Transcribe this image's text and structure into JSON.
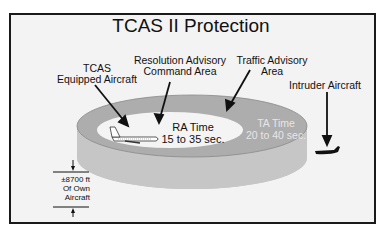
{
  "title": "TCAS II Protection",
  "labels": {
    "tcas_equipped": [
      "TCAS",
      "Equipped Aircraft"
    ],
    "ra_area": [
      "Resolution Advisory",
      "Command Area"
    ],
    "ta_area": [
      "Traffic Advisory",
      "Area"
    ],
    "intruder": "Intruder Aircraft"
  },
  "zones": {
    "ra": {
      "name": "RA Time",
      "range": "15 to 35 sec.",
      "color": "#f4f4f4"
    },
    "ta": {
      "name": "TA Time",
      "range": "20 to 40 sec.",
      "color": "#b0b0b0"
    }
  },
  "altitude": {
    "value": "±8700 ft",
    "line2": "Of Own",
    "line3": "Aircraft"
  },
  "colors": {
    "frame": "#1a1a1a",
    "background": "#f3f3f3",
    "cylinder_side": "#c4c4c4",
    "cylinder_top": "#b0b0b0",
    "inner": "#f4f4f4"
  }
}
